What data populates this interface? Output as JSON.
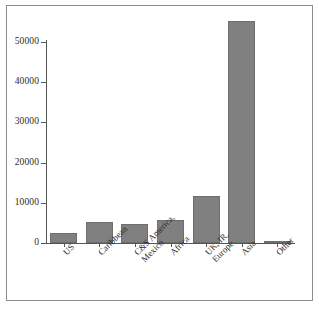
{
  "chart_data": {
    "type": "bar",
    "title": "",
    "subtitle": "",
    "xlabel": "",
    "ylabel": "",
    "categories": [
      "US",
      "Caribbean",
      "C&S America, Mexico",
      "Africa",
      "UK, IR, Europe",
      "Asia",
      "Other"
    ],
    "category_lines": [
      [
        "US"
      ],
      [
        "Caribbean"
      ],
      [
        "C&S America,",
        "Mexico"
      ],
      [
        "Africa"
      ],
      [
        "UK, IR,",
        "Europe"
      ],
      [
        "Asia"
      ],
      [
        "Other"
      ]
    ],
    "values": [
      2600,
      5100,
      4700,
      5600,
      11800,
      55200,
      600
    ],
    "ylim": [
      0,
      57000
    ],
    "yticks": [
      0,
      10000,
      20000,
      30000,
      40000,
      50000
    ],
    "ytick_labels": [
      "0",
      "10000",
      "20000",
      "30000",
      "40000",
      "50000"
    ],
    "grid": false,
    "legend": null,
    "bar_color": "#808080",
    "axis_color": "#555555",
    "frame_color": "#8c8c8c",
    "background": "#ffffff"
  }
}
